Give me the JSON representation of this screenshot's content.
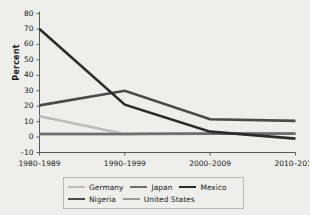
{
  "chart_data": {
    "type": "line",
    "title": "",
    "xlabel": "",
    "ylabel": "Percent",
    "categories": [
      "1980–1989",
      "1990–1999",
      "2000–2009",
      "2010–2011"
    ],
    "ylim": [
      -10,
      80
    ],
    "yticks": [
      -10,
      0,
      10,
      20,
      30,
      40,
      50,
      60,
      70,
      80
    ],
    "ytick_labels": [
      "–10",
      "0",
      "10",
      "20",
      "30",
      "40",
      "50",
      "60",
      "70",
      "80"
    ],
    "grid": false,
    "legend_position": "bottom",
    "series": [
      {
        "name": "Germany",
        "color": "#bcbcbc",
        "values": [
          13.5,
          2.0,
          2.5,
          2.5
        ]
      },
      {
        "name": "Japan",
        "color": "#6e6e6e",
        "values": [
          2.0,
          2.0,
          2.2,
          2.2
        ]
      },
      {
        "name": "Mexico",
        "color": "#2b2b2b",
        "values": [
          70.0,
          21.0,
          3.5,
          -1.0
        ]
      },
      {
        "name": "Nigeria",
        "color": "#4a4a4a",
        "values": [
          20.5,
          30.0,
          11.5,
          10.5
        ]
      },
      {
        "name": "United States",
        "color": "#9a9a9a",
        "values": [
          2.0,
          2.0,
          2.5,
          2.5
        ]
      }
    ]
  },
  "legend": {
    "rows": [
      [
        {
          "label": "Germany",
          "color": "#bcbcbc"
        },
        {
          "label": "Japan",
          "color": "#6e6e6e"
        },
        {
          "label": "Mexico",
          "color": "#2b2b2b"
        }
      ],
      [
        {
          "label": "Nigeria",
          "color": "#4a4a4a"
        },
        {
          "label": "United States",
          "color": "#9a9a9a"
        }
      ]
    ]
  },
  "colors": {
    "background": "#eeeeec",
    "axis": "#5a5a5a",
    "text": "#1a1a1a",
    "legend_border": "#b9b9b7"
  }
}
